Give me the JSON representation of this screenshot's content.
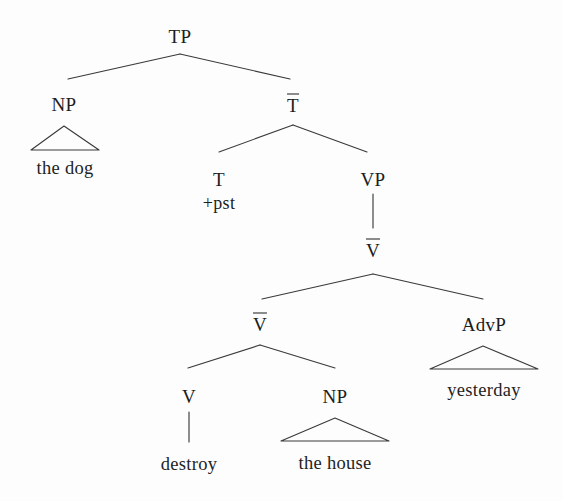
{
  "figure": {
    "type": "syntax-tree",
    "sentence": "the dog destroy +pst the house yesterday",
    "background_color": "#fdfdfd",
    "line_color": "#3a3a3a",
    "text_color": "#1c1c1c"
  },
  "nodes": {
    "tp": {
      "label": "TP",
      "x": 180,
      "y": 36
    },
    "np_subject": {
      "label": "NP",
      "x": 64,
      "y": 104
    },
    "np_subject_text": {
      "label": "the dog",
      "x": 65,
      "y": 168
    },
    "tbar": {
      "label": "T",
      "overline": true,
      "x": 293,
      "y": 104
    },
    "t_head": {
      "label": "T",
      "x": 219,
      "y": 179
    },
    "t_feature": {
      "label": "+pst",
      "x": 219,
      "y": 203
    },
    "vp": {
      "label": "VP",
      "x": 373,
      "y": 179
    },
    "vbar_top": {
      "label": "V",
      "overline": true,
      "x": 373,
      "y": 249
    },
    "vbar_lower": {
      "label": "V",
      "overline": true,
      "x": 260,
      "y": 323
    },
    "advp": {
      "label": "AdvP",
      "x": 484,
      "y": 324
    },
    "advp_text": {
      "label": "yesterday",
      "x": 484,
      "y": 390
    },
    "v_head": {
      "label": "V",
      "x": 189,
      "y": 396
    },
    "v_head_text": {
      "label": "destroy",
      "x": 189,
      "y": 464
    },
    "np_object": {
      "label": "NP",
      "x": 335,
      "y": 396
    },
    "np_object_text": {
      "label": "the house",
      "x": 335,
      "y": 463
    }
  },
  "edges": [
    {
      "name": "tp-to-np",
      "x1": 180,
      "y1": 54,
      "x2": 68,
      "y2": 79
    },
    {
      "name": "tp-to-tbar",
      "x1": 180,
      "y1": 54,
      "x2": 290,
      "y2": 79
    },
    {
      "name": "tbar-to-t",
      "x1": 293,
      "y1": 125,
      "x2": 219,
      "y2": 152
    },
    {
      "name": "tbar-to-vp",
      "x1": 293,
      "y1": 125,
      "x2": 367,
      "y2": 152
    },
    {
      "name": "vp-to-vbar",
      "x1": 373,
      "y1": 194,
      "x2": 373,
      "y2": 228
    },
    {
      "name": "vbar-top-to-vbar-lower",
      "x1": 373,
      "y1": 274,
      "x2": 262,
      "y2": 299
    },
    {
      "name": "vbar-top-to-advp",
      "x1": 373,
      "y1": 274,
      "x2": 483,
      "y2": 299
    },
    {
      "name": "vbar-lower-to-v",
      "x1": 260,
      "y1": 345,
      "x2": 188,
      "y2": 368
    },
    {
      "name": "vbar-lower-to-np",
      "x1": 260,
      "y1": 345,
      "x2": 335,
      "y2": 368
    },
    {
      "name": "v-to-destroy",
      "x1": 189,
      "y1": 412,
      "x2": 189,
      "y2": 442
    }
  ],
  "triangles": [
    {
      "name": "np-subject-triangle",
      "apex_x": 64,
      "apex_y": 126,
      "left_x": 31,
      "right_x": 99,
      "base_y": 150
    },
    {
      "name": "advp-triangle",
      "apex_x": 483,
      "apex_y": 346,
      "left_x": 430,
      "right_x": 538,
      "base_y": 369
    },
    {
      "name": "np-object-triangle",
      "apex_x": 335,
      "apex_y": 418,
      "left_x": 281,
      "right_x": 389,
      "base_y": 441
    }
  ]
}
